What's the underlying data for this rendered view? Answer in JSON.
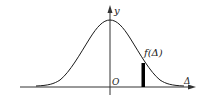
{
  "diagram": {
    "type": "normal-distribution-curve",
    "labels": {
      "y_axis": "y",
      "x_axis": "Δ",
      "origin": "O",
      "curve": "f(Δ)"
    },
    "colors": {
      "line": "#1a1a1a",
      "axis": "#333333",
      "bar": "#000000",
      "background": "#ffffff"
    }
  }
}
